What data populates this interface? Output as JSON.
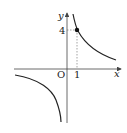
{
  "diagram": {
    "type": "function-graph",
    "function": "y = 4/x",
    "axes": {
      "x_label": "x",
      "y_label": "y",
      "origin_label": "O"
    },
    "ticks": {
      "x_tick": "1",
      "y_tick": "4"
    },
    "marked_point": {
      "x": 1,
      "y": 4
    },
    "colors": {
      "curve": "#222222",
      "axis": "#444444",
      "dashed": "#666666"
    }
  }
}
